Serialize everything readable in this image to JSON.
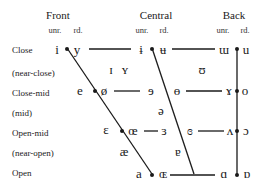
{
  "headers": {
    "front": "Front",
    "central": "Central",
    "back": "Back",
    "unr": "unr.",
    "rd": "rd."
  },
  "rows": {
    "close": "Close",
    "near_close": "(near-close)",
    "close_mid": "Close-mid",
    "mid": "(mid)",
    "open_mid": "Open-mid",
    "near_open": "(near-open)",
    "open": "Open"
  },
  "vowels": {
    "close_front_unr": "i",
    "close_front_rd": "y",
    "close_central_unr": "ɨ",
    "close_central_rd": "ʉ",
    "close_back_unr": "ɯ",
    "close_back_rd": "u",
    "near_close_front_unr": "ɪ",
    "near_close_front_rd": "ʏ",
    "near_close_back_rd": "ʊ",
    "close_mid_front_unr": "e",
    "close_mid_front_rd": "ø",
    "close_mid_central_unr": "ɘ",
    "close_mid_central_rd": "ɵ",
    "close_mid_back_unr": "ɤ",
    "close_mid_back_rd": "o",
    "mid_central": "ə",
    "open_mid_front_unr": "ɛ",
    "open_mid_front_rd": "œ",
    "open_mid_central_unr": "ɜ",
    "open_mid_central_rd": "ɞ",
    "open_mid_back_unr": "ʌ",
    "open_mid_back_rd": "ɔ",
    "near_open_front": "æ",
    "near_open_central": "ɐ",
    "open_front_unr": "a",
    "open_front_rd": "ɶ",
    "open_back_unr": "ɑ",
    "open_back_rd": "ɒ"
  },
  "colors": {
    "line": "#1a1a1a",
    "background": "#ffffff"
  }
}
